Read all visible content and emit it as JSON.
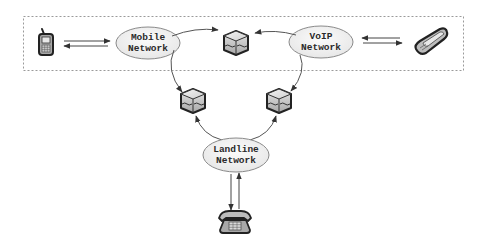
{
  "diagram": {
    "type": "network-topology",
    "colors": {
      "line": "#555555",
      "dashed_border": "#9a9a9a",
      "ellipse_fill": "#f2f2f2",
      "ellipse_stroke": "#8a8a8a",
      "device_dark": "#2b2b2b",
      "device_fill": "#bdbdbd"
    },
    "group": {
      "name": "wireless-voip-region",
      "style": "dashed"
    },
    "nodes": [
      {
        "id": "mobile-phone",
        "kind": "device",
        "icon": "mobile-phone-icon"
      },
      {
        "id": "mobile-network",
        "kind": "network",
        "line1": "Mobile",
        "line2": "Network"
      },
      {
        "id": "gateway-top",
        "kind": "gateway",
        "icon": "gateway-cube-icon"
      },
      {
        "id": "voip-network",
        "kind": "network",
        "line1": "VoIP",
        "line2": "Network"
      },
      {
        "id": "softphone",
        "kind": "device",
        "icon": "voip-phone-icon"
      },
      {
        "id": "gateway-left",
        "kind": "gateway",
        "icon": "gateway-cube-icon"
      },
      {
        "id": "gateway-right",
        "kind": "gateway",
        "icon": "gateway-cube-icon"
      },
      {
        "id": "landline-network",
        "kind": "network",
        "line1": "Landline",
        "line2": "Network"
      },
      {
        "id": "desk-phone",
        "kind": "device",
        "icon": "landline-phone-icon"
      }
    ],
    "edges": [
      {
        "from": "mobile-phone",
        "to": "mobile-network",
        "direction": "bidirectional"
      },
      {
        "from": "mobile-network",
        "to": "gateway-top",
        "direction": "forward"
      },
      {
        "from": "mobile-network",
        "to": "gateway-left",
        "direction": "forward"
      },
      {
        "from": "voip-network",
        "to": "gateway-top",
        "direction": "forward"
      },
      {
        "from": "voip-network",
        "to": "gateway-right",
        "direction": "forward"
      },
      {
        "from": "voip-network",
        "to": "softphone",
        "direction": "bidirectional"
      },
      {
        "from": "landline-network",
        "to": "gateway-left",
        "direction": "forward"
      },
      {
        "from": "landline-network",
        "to": "gateway-right",
        "direction": "forward"
      },
      {
        "from": "landline-network",
        "to": "desk-phone",
        "direction": "bidirectional"
      }
    ]
  },
  "labels": {
    "mobile": {
      "line1": "Mobile",
      "line2": "Network"
    },
    "voip": {
      "line1": "VoIP",
      "line2": "Network"
    },
    "landline": {
      "line1": "Landline",
      "line2": "Network"
    }
  }
}
